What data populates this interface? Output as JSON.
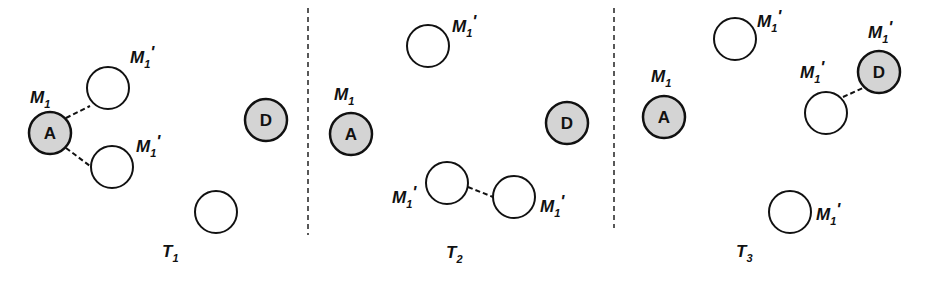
{
  "diagram": {
    "panels": [
      {
        "title": "T",
        "title_sub": "1"
      },
      {
        "title": "T",
        "title_sub": "2"
      },
      {
        "title": "T",
        "title_sub": "3"
      }
    ],
    "node_labels": {
      "A": "A",
      "D": "D"
    },
    "labels": {
      "m1": "M",
      "m1_sub": "1",
      "prime": "'"
    },
    "colors": {
      "shaded_fill": "#d4d4d4",
      "stroke": "#111111",
      "background": "#ffffff"
    }
  }
}
